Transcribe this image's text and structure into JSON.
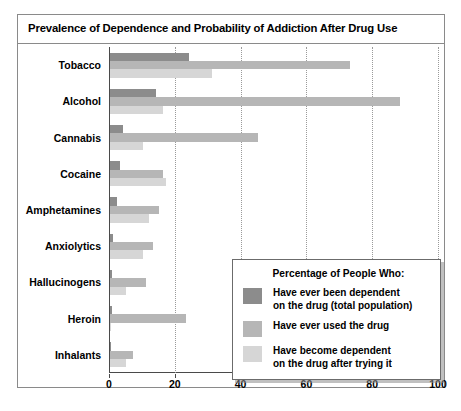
{
  "chart_data": {
    "type": "bar",
    "orientation": "horizontal",
    "title": "Prevalence of Dependence and Probability of Addiction After Drug Use",
    "xlabel": "",
    "ylabel": "",
    "xlim": [
      0,
      100
    ],
    "xticks": [
      0,
      20,
      40,
      60,
      80,
      100
    ],
    "xtick_labels": [
      "0",
      "20",
      "40",
      "60",
      "80",
      "100"
    ],
    "grid": "vertical dotted gridlines at each tick",
    "legend_position": "inside lower right",
    "legend_title": "Percentage of People Who:",
    "categories": [
      "Tobacco",
      "Alcohol",
      "Cannabis",
      "Cocaine",
      "Amphetamines",
      "Anxiolytics",
      "Hallucinogens",
      "Heroin",
      "Inhalants"
    ],
    "series": [
      {
        "name": "Have ever been dependent\non the drug (total population)",
        "color": "#8c8c8c",
        "values": [
          24,
          14,
          4,
          3,
          2,
          1,
          0.5,
          0.5,
          0.3
        ]
      },
      {
        "name": "Have ever used the drug",
        "color": "#b6b6b6",
        "values": [
          73,
          88,
          45,
          16,
          15,
          13,
          11,
          23,
          7
        ]
      },
      {
        "name": "Have become dependent\non the drug after trying it",
        "color": "#d6d6d6",
        "values": [
          31,
          16,
          10,
          17,
          12,
          10,
          5,
          0.4,
          5
        ]
      }
    ]
  },
  "legend": {
    "title": "Percentage of People Who:",
    "items": [
      {
        "swatch": "s0",
        "label": "Have ever been dependent\non the drug (total population)"
      },
      {
        "swatch": "s1",
        "label": "Have ever used the drug"
      },
      {
        "swatch": "s2",
        "label": "Have become dependent\non the drug after trying it"
      }
    ]
  }
}
